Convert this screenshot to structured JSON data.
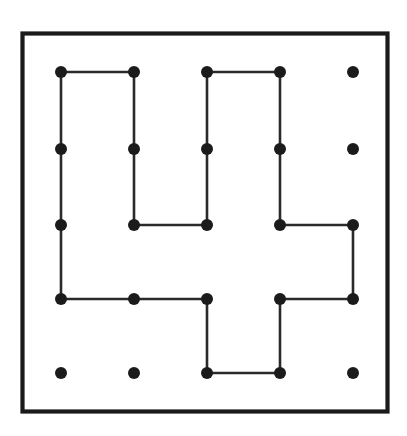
{
  "figure": {
    "title": "Lattice dot grid with closed pinwheel polygon",
    "caption": "",
    "background_color": "#ffffff",
    "ink_color": "#1b1b1b",
    "line_color": "#2a2a2a",
    "frame_color": "#1a1a1a"
  },
  "frame": {
    "name": "outer-border",
    "x": 22.5,
    "y": 33.5,
    "width": 365,
    "height": 378,
    "stroke_width": 4.2
  },
  "chart_data": {
    "type": "scatter",
    "title": "Lattice dot grid with closed pinwheel polygon",
    "xlabel": "",
    "ylabel": "",
    "grid": false,
    "legend": null,
    "grid_shape": {
      "columns": 5,
      "rows": 5,
      "total_points": 25
    },
    "column_x": [
      61,
      134,
      207,
      280,
      353
    ],
    "row_y": [
      72,
      149,
      225,
      299,
      373
    ],
    "column_spacing": 73,
    "row_spacing": 75.25,
    "dot_radius": 6,
    "points": [
      {
        "id": "c1r1",
        "col": 1,
        "row": 1,
        "x": 61,
        "y": 72,
        "on_path": true
      },
      {
        "id": "c2r1",
        "col": 2,
        "row": 1,
        "x": 134,
        "y": 72,
        "on_path": true
      },
      {
        "id": "c3r1",
        "col": 3,
        "row": 1,
        "x": 207,
        "y": 72,
        "on_path": true
      },
      {
        "id": "c4r1",
        "col": 4,
        "row": 1,
        "x": 280,
        "y": 72,
        "on_path": true
      },
      {
        "id": "c5r1",
        "col": 5,
        "row": 1,
        "x": 353,
        "y": 72,
        "on_path": false
      },
      {
        "id": "c1r2",
        "col": 1,
        "row": 2,
        "x": 61,
        "y": 149,
        "on_path": true
      },
      {
        "id": "c2r2",
        "col": 2,
        "row": 2,
        "x": 134,
        "y": 149,
        "on_path": true
      },
      {
        "id": "c3r2",
        "col": 3,
        "row": 2,
        "x": 207,
        "y": 149,
        "on_path": true
      },
      {
        "id": "c4r2",
        "col": 4,
        "row": 2,
        "x": 280,
        "y": 149,
        "on_path": true
      },
      {
        "id": "c5r2",
        "col": 5,
        "row": 2,
        "x": 353,
        "y": 149,
        "on_path": false
      },
      {
        "id": "c1r3",
        "col": 1,
        "row": 3,
        "x": 61,
        "y": 225,
        "on_path": true
      },
      {
        "id": "c2r3",
        "col": 2,
        "row": 3,
        "x": 134,
        "y": 225,
        "on_path": true
      },
      {
        "id": "c3r3",
        "col": 3,
        "row": 3,
        "x": 207,
        "y": 225,
        "on_path": true
      },
      {
        "id": "c4r3",
        "col": 4,
        "row": 3,
        "x": 280,
        "y": 225,
        "on_path": true
      },
      {
        "id": "c5r3",
        "col": 5,
        "row": 3,
        "x": 353,
        "y": 225,
        "on_path": true
      },
      {
        "id": "c1r4",
        "col": 1,
        "row": 4,
        "x": 61,
        "y": 299,
        "on_path": true
      },
      {
        "id": "c2r4",
        "col": 2,
        "row": 4,
        "x": 134,
        "y": 299,
        "on_path": true
      },
      {
        "id": "c3r4",
        "col": 3,
        "row": 4,
        "x": 207,
        "y": 299,
        "on_path": true
      },
      {
        "id": "c4r4",
        "col": 4,
        "row": 4,
        "x": 280,
        "y": 299,
        "on_path": true
      },
      {
        "id": "c5r4",
        "col": 5,
        "row": 4,
        "x": 353,
        "y": 299,
        "on_path": true
      },
      {
        "id": "c1r5",
        "col": 1,
        "row": 5,
        "x": 61,
        "y": 373,
        "on_path": false
      },
      {
        "id": "c2r5",
        "col": 2,
        "row": 5,
        "x": 134,
        "y": 373,
        "on_path": false
      },
      {
        "id": "c3r5",
        "col": 3,
        "row": 5,
        "x": 207,
        "y": 373,
        "on_path": true
      },
      {
        "id": "c4r5",
        "col": 4,
        "row": 5,
        "x": 280,
        "y": 373,
        "on_path": true
      },
      {
        "id": "c5r5",
        "col": 5,
        "row": 5,
        "x": 353,
        "y": 373,
        "on_path": false
      }
    ],
    "polygon": {
      "closed": true,
      "vertex_ids": [
        "c1r1",
        "c2r1",
        "c2r3",
        "c3r3",
        "c3r1",
        "c4r1",
        "c4r3",
        "c5r3",
        "c5r4",
        "c4r4",
        "c4r5",
        "c3r5",
        "c3r4",
        "c1r4"
      ],
      "vertices": [
        {
          "x": 61,
          "y": 72
        },
        {
          "x": 134,
          "y": 72
        },
        {
          "x": 134,
          "y": 225
        },
        {
          "x": 207,
          "y": 225
        },
        {
          "x": 207,
          "y": 72
        },
        {
          "x": 280,
          "y": 72
        },
        {
          "x": 280,
          "y": 225
        },
        {
          "x": 353,
          "y": 225
        },
        {
          "x": 353,
          "y": 299
        },
        {
          "x": 280,
          "y": 299
        },
        {
          "x": 280,
          "y": 373
        },
        {
          "x": 207,
          "y": 373
        },
        {
          "x": 207,
          "y": 299
        },
        {
          "x": 61,
          "y": 299
        }
      ],
      "segments": [
        {
          "from": "c1r1",
          "to": "c2r1",
          "x1": 61,
          "y1": 72,
          "x2": 134,
          "y2": 72,
          "orientation": "horizontal"
        },
        {
          "from": "c2r1",
          "to": "c2r3",
          "x1": 134,
          "y1": 72,
          "x2": 134,
          "y2": 225,
          "orientation": "vertical"
        },
        {
          "from": "c2r3",
          "to": "c3r3",
          "x1": 134,
          "y1": 225,
          "x2": 207,
          "y2": 225,
          "orientation": "horizontal"
        },
        {
          "from": "c3r3",
          "to": "c3r1",
          "x1": 207,
          "y1": 225,
          "x2": 207,
          "y2": 72,
          "orientation": "vertical"
        },
        {
          "from": "c3r1",
          "to": "c4r1",
          "x1": 207,
          "y1": 72,
          "x2": 280,
          "y2": 72,
          "orientation": "horizontal"
        },
        {
          "from": "c4r1",
          "to": "c4r3",
          "x1": 280,
          "y1": 72,
          "x2": 280,
          "y2": 225,
          "orientation": "vertical"
        },
        {
          "from": "c4r3",
          "to": "c5r3",
          "x1": 280,
          "y1": 225,
          "x2": 353,
          "y2": 225,
          "orientation": "horizontal"
        },
        {
          "from": "c5r3",
          "to": "c5r4",
          "x1": 353,
          "y1": 225,
          "x2": 353,
          "y2": 299,
          "orientation": "vertical"
        },
        {
          "from": "c5r4",
          "to": "c4r4",
          "x1": 353,
          "y1": 299,
          "x2": 280,
          "y2": 299,
          "orientation": "horizontal"
        },
        {
          "from": "c4r4",
          "to": "c4r5",
          "x1": 280,
          "y1": 299,
          "x2": 280,
          "y2": 373,
          "orientation": "vertical"
        },
        {
          "from": "c4r5",
          "to": "c3r5",
          "x1": 280,
          "y1": 373,
          "x2": 207,
          "y2": 373,
          "orientation": "horizontal"
        },
        {
          "from": "c3r5",
          "to": "c3r4",
          "x1": 207,
          "y1": 373,
          "x2": 207,
          "y2": 299,
          "orientation": "vertical"
        },
        {
          "from": "c3r4",
          "to": "c1r4",
          "x1": 207,
          "y1": 299,
          "x2": 61,
          "y2": 299,
          "orientation": "horizontal"
        },
        {
          "from": "c1r4",
          "to": "c1r1",
          "x1": 61,
          "y1": 299,
          "x2": 61,
          "y2": 72,
          "orientation": "vertical"
        }
      ]
    },
    "isolated_point_ids": [
      "c5r1",
      "c5r2",
      "c1r5",
      "c2r5",
      "c5r5"
    ]
  }
}
